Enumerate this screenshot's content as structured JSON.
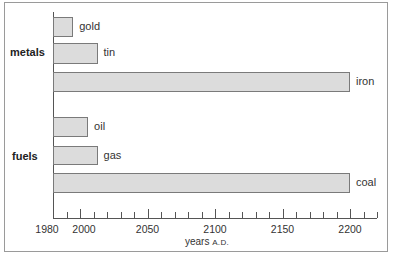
{
  "chart_data": {
    "type": "bar",
    "orientation": "horizontal",
    "title": "",
    "xlabel": "years A.D.",
    "ylabel": "",
    "xlim": [
      1980,
      2224
    ],
    "x_ticks": [
      1980,
      2000,
      2050,
      2100,
      2150,
      2200
    ],
    "minor_tick_interval": 10,
    "grid": false,
    "legend": null,
    "groups": [
      {
        "name": "metals",
        "items": [
          {
            "label": "gold",
            "start": 1980,
            "end": 1995
          },
          {
            "label": "tin",
            "start": 1980,
            "end": 2013
          },
          {
            "label": "iron",
            "start": 1980,
            "end": 2200
          }
        ]
      },
      {
        "name": "fuels",
        "items": [
          {
            "label": "oil",
            "start": 1980,
            "end": 2006
          },
          {
            "label": "gas",
            "start": 1980,
            "end": 2013
          },
          {
            "label": "coal",
            "start": 1980,
            "end": 2200
          }
        ]
      }
    ],
    "categories": [
      "gold",
      "tin",
      "iron",
      "oil",
      "gas",
      "coal"
    ],
    "values": [
      1995,
      2013,
      2200,
      2006,
      2013,
      2200
    ]
  },
  "labels": {
    "group_metals": "metals",
    "group_fuels": "fuels",
    "gold": "gold",
    "tin": "tin",
    "iron": "iron",
    "oil": "oil",
    "gas": "gas",
    "coal": "coal",
    "x_axis_main": "years ",
    "x_axis_sc": "A.D.",
    "ticks": [
      "1980",
      "2000",
      "2050",
      "2100",
      "2150",
      "2200"
    ]
  },
  "colors": {
    "bar_fill": "#dcdcdc",
    "bar_border": "#7a7a7a",
    "axis": "#555555"
  }
}
